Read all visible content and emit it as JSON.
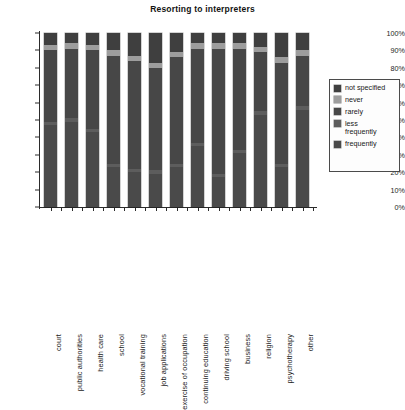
{
  "chart_data": {
    "type": "bar",
    "subtype": "100% stacked column",
    "title": "Resorting to interpreters",
    "xlabel": "",
    "ylabel": "",
    "ylim": [
      0,
      100
    ],
    "ytick_labels": [
      "0%",
      "10%",
      "20%",
      "30%",
      "40%",
      "50%",
      "60%",
      "70%",
      "80%",
      "90%",
      "100%"
    ],
    "ytick_values": [
      0,
      10,
      20,
      30,
      40,
      50,
      60,
      70,
      80,
      90,
      100
    ],
    "grid": false,
    "legend_position": "right",
    "units": "percent",
    "categories": [
      "court",
      "public authorities",
      "health care",
      "school",
      "vocational training",
      "job applications",
      "exercise of occupation",
      "continuing education",
      "driving school",
      "business",
      "religion",
      "psychotherapy",
      "other"
    ],
    "series": [
      {
        "name": "frequently",
        "color": "#4a4a4a",
        "values": [
          47,
          49,
          43,
          23,
          20,
          19,
          23,
          35,
          17,
          31,
          53,
          23,
          56
        ]
      },
      {
        "name": "less frequently",
        "color": "#5d5d5d",
        "values": [
          2,
          2,
          2,
          2,
          2,
          2,
          2,
          2,
          2,
          2,
          2,
          2,
          2
        ]
      },
      {
        "name": "rarely",
        "color": "#474747",
        "values": [
          41,
          40,
          45,
          62,
          62,
          59,
          61,
          54,
          72,
          58,
          34,
          58,
          29
        ]
      },
      {
        "name": "never",
        "color": "#9d9d9d",
        "values": [
          3,
          3,
          3,
          3,
          3,
          3,
          3,
          3,
          3,
          3,
          3,
          3,
          3
        ]
      },
      {
        "name": "not specified",
        "color": "#3f3f3f",
        "values": [
          7,
          6,
          7,
          10,
          13,
          17,
          11,
          6,
          6,
          6,
          8,
          14,
          10
        ]
      }
    ]
  },
  "legend": {
    "items": [
      {
        "label": "not specified",
        "color": "#3f3f3f"
      },
      {
        "label": "never",
        "color": "#9d9d9d"
      },
      {
        "label": "rarely",
        "color": "#474747"
      },
      {
        "label": "less\nfrequently",
        "color": "#5d5d5d"
      },
      {
        "label": "frequently",
        "color": "#4a4a4a"
      }
    ]
  }
}
